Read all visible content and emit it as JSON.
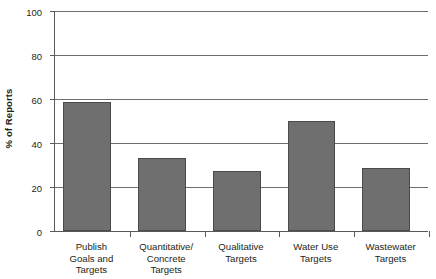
{
  "chart_data": {
    "type": "bar",
    "title": "",
    "xlabel": "",
    "ylabel": "% of Reports",
    "ylim": [
      0,
      100
    ],
    "yticks": [
      0,
      20,
      40,
      60,
      80,
      100
    ],
    "ytick_labels": [
      "0",
      "20",
      "40",
      "60",
      "80",
      "100"
    ],
    "grid": true,
    "legend": "none",
    "bar_color": "#6f6f6f",
    "bar_edge_color": "#4a4a4a",
    "axis_color": "#58595b",
    "categories": [
      "Publish Goals and Targets",
      "Quantitative/Concrete Targets",
      "Qualitative Targets",
      "Water Use Targets",
      "Wastewater Targets"
    ],
    "category_lines": [
      [
        "Publish",
        "Goals and",
        "Targets"
      ],
      [
        "Quantitative/",
        "Concrete",
        "Targets"
      ],
      [
        "Qualitative",
        "Targets"
      ],
      [
        "Water Use",
        "Targets"
      ],
      [
        "Wastewater",
        "Targets"
      ]
    ],
    "values": [
      58.5,
      33,
      27.5,
      50,
      28.5
    ]
  }
}
